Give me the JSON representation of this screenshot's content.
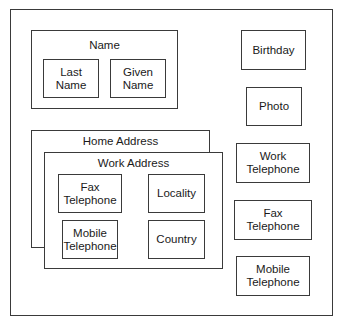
{
  "diagram": {
    "type": "nested-box-diagram",
    "groups": {
      "name": {
        "label": "Name",
        "children": [
          "Last\nName",
          "Given\nName"
        ]
      },
      "home_address": {
        "label": "Home Address"
      },
      "work_address": {
        "label": "Work Address",
        "children": [
          "Fax Telephone",
          "Locality",
          "Mobile Telephone",
          "Country"
        ]
      }
    },
    "name_children": {
      "last_name": "Last Name",
      "given_name": "Given Name"
    },
    "work_children": {
      "fax_telephone": "Fax Telephone",
      "locality": "Locality",
      "mobile_telephone": "Mobile Telephone",
      "country": "Country"
    },
    "standalone": {
      "birthday": "Birthday",
      "photo": "Photo",
      "work_telephone": "Work Telephone",
      "fax_telephone": "Fax Telephone",
      "mobile_telephone": "Mobile Telephone"
    }
  }
}
